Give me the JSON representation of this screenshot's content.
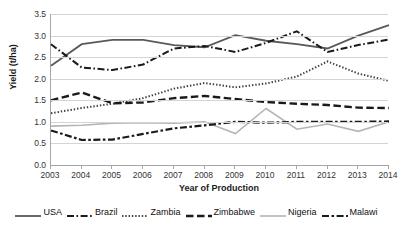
{
  "chart_data": {
    "type": "line",
    "title": "",
    "xlabel": "Year of Production",
    "ylabel": "Yield (t/ha)",
    "x": [
      2003,
      2004,
      2005,
      2006,
      2007,
      2008,
      2009,
      2010,
      2011,
      2012,
      2013,
      2014
    ],
    "categories": [
      "2003",
      "2004",
      "2005",
      "2006",
      "2007",
      "2008",
      "2009",
      "2010",
      "2011",
      "2012",
      "2013",
      "2014"
    ],
    "xlim": [
      2003,
      2014
    ],
    "ylim": [
      0.0,
      3.5
    ],
    "yticks": [
      "0.0",
      "0.5",
      "1.0",
      "1.5",
      "2.0",
      "2.5",
      "3.0",
      "3.5"
    ],
    "ytick_values": [
      0.0,
      0.5,
      1.0,
      1.5,
      2.0,
      2.5,
      3.0,
      3.5
    ],
    "grid": true,
    "legend_position": "bottom",
    "series": [
      {
        "name": "USA",
        "values": [
          2.3,
          2.8,
          2.9,
          2.9,
          2.78,
          2.73,
          3.01,
          2.88,
          2.8,
          2.7,
          3.0,
          3.24
        ],
        "color": "#595959",
        "dash": "none",
        "width": 1.8
      },
      {
        "name": "Brazil",
        "values": [
          2.8,
          2.26,
          2.2,
          2.33,
          2.7,
          2.76,
          2.62,
          2.83,
          3.1,
          2.62,
          2.78,
          2.91
        ],
        "color": "#1a1a1a",
        "dash": "7,2.5,1.6,2.5",
        "width": 2.0
      },
      {
        "name": "Zambia",
        "values": [
          1.2,
          1.32,
          1.42,
          1.55,
          1.77,
          1.9,
          1.8,
          1.89,
          2.05,
          2.4,
          2.12,
          1.95
        ],
        "color": "#3f3f3f",
        "dash": "1.4,1.9",
        "width": 2.0
      },
      {
        "name": "Zimbabwe",
        "values": [
          1.5,
          1.68,
          1.43,
          1.45,
          1.55,
          1.6,
          1.53,
          1.46,
          1.42,
          1.39,
          1.33,
          1.32
        ],
        "color": "#1a1a1a",
        "dash": "7.5,3.5",
        "width": 2.4
      },
      {
        "name": "Nigeria",
        "values": [
          0.9,
          0.92,
          0.97,
          0.98,
          0.97,
          1.0,
          0.73,
          1.31,
          0.83,
          0.95,
          0.78,
          1.0
        ],
        "color": "#b5b5b5",
        "dash": "none",
        "width": 1.6
      },
      {
        "name": "Malawi",
        "values": [
          0.8,
          0.58,
          0.59,
          0.72,
          0.85,
          0.92,
          1.0,
          0.98,
          1.0,
          1.0,
          1.0,
          1.01
        ],
        "color": "#1a1a1a",
        "dash": "7,2.5,2.6,2.5",
        "width": 2.2
      }
    ]
  },
  "legend": {
    "items": [
      {
        "label": "USA",
        "style": "solid-dark"
      },
      {
        "label": "Brazil",
        "style": "dash-dot"
      },
      {
        "label": "Zambia",
        "style": "dotted"
      },
      {
        "label": "Zimbabwe",
        "style": "dashed"
      },
      {
        "label": "Nigeria",
        "style": "solid-light"
      },
      {
        "label": "Malawi",
        "style": "dash-dot-dash"
      }
    ]
  }
}
